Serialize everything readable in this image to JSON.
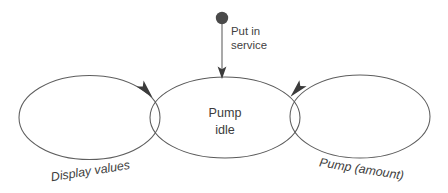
{
  "diagram": {
    "type": "uml-state-machine",
    "background_color": "#ffffff",
    "stroke_color": "#595959",
    "text_color": "#3c3c3c",
    "states": [
      {
        "id": "pump-idle",
        "label_line1": "Pump",
        "label_line2": "idle",
        "cx": 225,
        "cy": 117,
        "rx": 75,
        "ry": 41
      }
    ],
    "initial_state": {
      "marker": "filled-circle",
      "cx": 222,
      "cy": 18,
      "r": 6,
      "color": "#4a4a4a"
    },
    "transitions": [
      {
        "id": "put-in-service",
        "label_line1": "Put in",
        "label_line2": "service",
        "from": "initial",
        "to": "pump-idle",
        "style": "straight-vertical",
        "italic": false,
        "arrow_tip_x": 222,
        "arrow_tip_y": 78
      },
      {
        "id": "display-values",
        "label": "Display values",
        "from": "pump-idle",
        "to": "pump-idle",
        "style": "self-loop-left",
        "italic": true,
        "label_rotation": -9,
        "label_x": 91,
        "label_y": 175,
        "arrow_tip_x": 152,
        "arrow_tip_y": 97
      },
      {
        "id": "pump-amount",
        "label": "Pump (amount)",
        "from": "pump-idle",
        "to": "pump-idle",
        "style": "self-loop-right",
        "italic": true,
        "label_rotation": 9,
        "label_x": 361,
        "label_y": 173,
        "arrow_tip_x": 291,
        "arrow_tip_y": 96
      }
    ]
  }
}
